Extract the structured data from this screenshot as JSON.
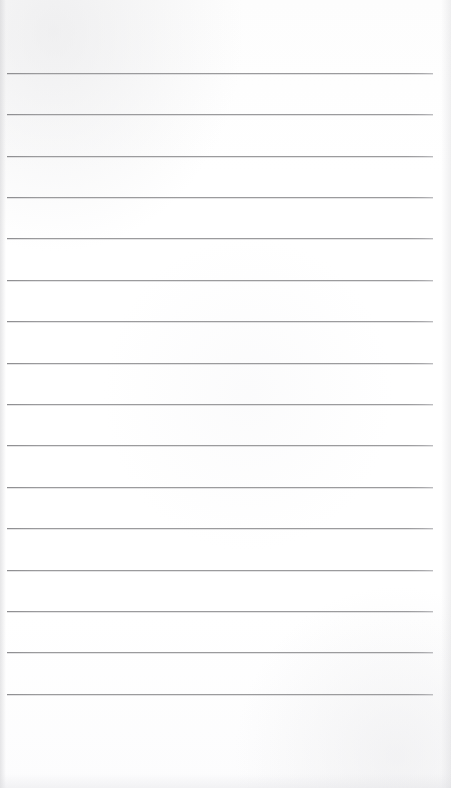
{
  "page": {
    "name": "blank-lined-paper-scan",
    "width_px": 451,
    "height_px": 788,
    "background_color": "#fefefe",
    "content_text": "",
    "visible_text_present": false
  },
  "ruling": {
    "kind": "horizontal-ruled-lines",
    "line_color": "#9b9b9d",
    "line_thickness_px": 1,
    "line_count": 16,
    "line_left_x_px": 7,
    "line_right_x_px": 433,
    "line_length_px": 426,
    "line_spacing_px": 41.4,
    "first_line_y_px": 73,
    "last_line_y_px": 694,
    "top_margin_px": 73,
    "bottom_margin_px": 94,
    "lines": [
      {
        "index": 1,
        "y_px": 73,
        "content": ""
      },
      {
        "index": 2,
        "y_px": 114,
        "content": ""
      },
      {
        "index": 3,
        "y_px": 156,
        "content": ""
      },
      {
        "index": 4,
        "y_px": 197,
        "content": ""
      },
      {
        "index": 5,
        "y_px": 238,
        "content": ""
      },
      {
        "index": 6,
        "y_px": 280,
        "content": ""
      },
      {
        "index": 7,
        "y_px": 321,
        "content": ""
      },
      {
        "index": 8,
        "y_px": 363,
        "content": ""
      },
      {
        "index": 9,
        "y_px": 404,
        "content": ""
      },
      {
        "index": 10,
        "y_px": 445,
        "content": ""
      },
      {
        "index": 11,
        "y_px": 487,
        "content": ""
      },
      {
        "index": 12,
        "y_px": 528,
        "content": ""
      },
      {
        "index": 13,
        "y_px": 570,
        "content": ""
      },
      {
        "index": 14,
        "y_px": 611,
        "content": ""
      },
      {
        "index": 15,
        "y_px": 652,
        "content": ""
      },
      {
        "index": 16,
        "y_px": 694,
        "content": ""
      }
    ]
  }
}
